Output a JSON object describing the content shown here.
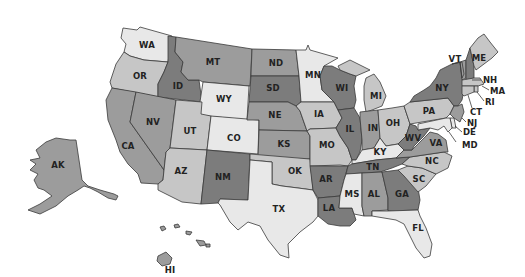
{
  "map": {
    "title": "United States choropleth map",
    "shades": {
      "lightest": "#e8e8e8",
      "light": "#c6c6c6",
      "medium": "#9c9c9c",
      "dark": "#7c7c7c"
    },
    "states": {
      "WA": {
        "label": "WA",
        "shade": "lightest"
      },
      "OR": {
        "label": "OR",
        "shade": "light"
      },
      "CA": {
        "label": "CA",
        "shade": "medium"
      },
      "ID": {
        "label": "ID",
        "shade": "dark"
      },
      "NV": {
        "label": "NV",
        "shade": "medium"
      },
      "MT": {
        "label": "MT",
        "shade": "medium"
      },
      "WY": {
        "label": "WY",
        "shade": "lightest"
      },
      "UT": {
        "label": "UT",
        "shade": "light"
      },
      "CO": {
        "label": "CO",
        "shade": "lightest"
      },
      "AZ": {
        "label": "AZ",
        "shade": "light"
      },
      "NM": {
        "label": "NM",
        "shade": "dark"
      },
      "ND": {
        "label": "ND",
        "shade": "medium"
      },
      "SD": {
        "label": "SD",
        "shade": "dark"
      },
      "NE": {
        "label": "NE",
        "shade": "medium"
      },
      "KS": {
        "label": "KS",
        "shade": "medium"
      },
      "OK": {
        "label": "OK",
        "shade": "light"
      },
      "TX": {
        "label": "TX",
        "shade": "lightest"
      },
      "MN": {
        "label": "MN",
        "shade": "lightest"
      },
      "IA": {
        "label": "IA",
        "shade": "light"
      },
      "MO": {
        "label": "MO",
        "shade": "light"
      },
      "AR": {
        "label": "AR",
        "shade": "dark"
      },
      "LA": {
        "label": "LA",
        "shade": "dark"
      },
      "WI": {
        "label": "WI",
        "shade": "dark"
      },
      "IL": {
        "label": "IL",
        "shade": "dark"
      },
      "MI": {
        "label": "MI",
        "shade": "light"
      },
      "IN": {
        "label": "IN",
        "shade": "medium"
      },
      "OH": {
        "label": "OH",
        "shade": "light"
      },
      "KY": {
        "label": "KY",
        "shade": "lightest"
      },
      "TN": {
        "label": "TN",
        "shade": "dark"
      },
      "MS": {
        "label": "MS",
        "shade": "lightest"
      },
      "AL": {
        "label": "AL",
        "shade": "medium"
      },
      "GA": {
        "label": "GA",
        "shade": "dark"
      },
      "FL": {
        "label": "FL",
        "shade": "lightest"
      },
      "SC": {
        "label": "SC",
        "shade": "light"
      },
      "NC": {
        "label": "NC",
        "shade": "light"
      },
      "VA": {
        "label": "VA",
        "shade": "medium"
      },
      "WV": {
        "label": "WV",
        "shade": "dark"
      },
      "PA": {
        "label": "PA",
        "shade": "light"
      },
      "NY": {
        "label": "NY",
        "shade": "dark"
      },
      "VT": {
        "label": "VT",
        "shade": "medium"
      },
      "NH": {
        "label": "NH",
        "shade": "dark"
      },
      "ME": {
        "label": "ME",
        "shade": "light"
      },
      "MA": {
        "label": "MA",
        "shade": "light"
      },
      "RI": {
        "label": "RI",
        "shade": "light"
      },
      "CT": {
        "label": "CT",
        "shade": "light"
      },
      "NJ": {
        "label": "NJ",
        "shade": "medium"
      },
      "DE": {
        "label": "DE",
        "shade": "lightest"
      },
      "MD": {
        "label": "MD",
        "shade": "lightest"
      },
      "AK": {
        "label": "AK",
        "shade": "medium"
      },
      "HI": {
        "label": "HI",
        "shade": "medium"
      }
    }
  }
}
